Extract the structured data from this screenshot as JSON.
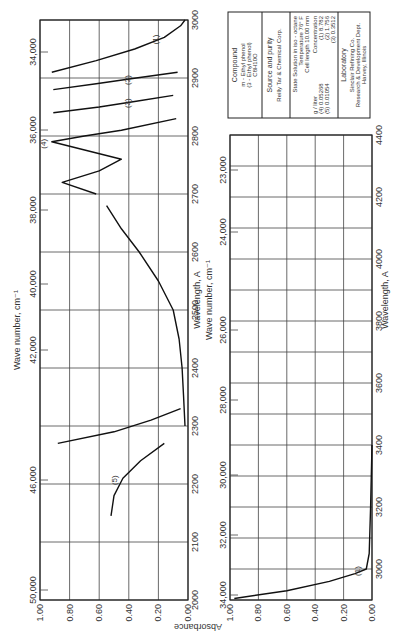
{
  "page": {
    "orientation": "rotated 90 degrees counterclockwise",
    "absorbance_label": "Absorbance"
  },
  "info_box": {
    "compound_heading": "Compound",
    "compound_lines": [
      "m - Ethyl phenol",
      "(3 - Ethyl phenol)",
      "C8H10O"
    ],
    "source_heading": "Source and purity",
    "source_line": "Reilly Tar & Chemical Corp.",
    "state_line": "State  Solution in iso - octane",
    "temperature_line": "Temperature  76° F",
    "cell_line": "Cell length  10.00 mm",
    "concentration_heading": "Concentration",
    "concentration_unit": "g / liter",
    "concentrations": [
      "(1) 8.782",
      "(2) 1.756",
      "(3) 0.3512",
      "(4) 0.05268",
      "(5) 0.01054"
    ],
    "lab_heading": "Laboratory",
    "lab_lines": [
      "Sinclair Refining Co.",
      "Research & Development Dept.",
      "Harvey, Illinois"
    ]
  },
  "chart_data": [
    {
      "type": "line",
      "title": "m-Ethyl phenol UV absorption spectrum (panel 1)",
      "xlabel": "Wavelength, A",
      "x2label": "Wave number, cm⁻¹",
      "ylabel": "Absorbance",
      "xlim": [
        2000,
        3000
      ],
      "ylim": [
        0.0,
        1.0
      ],
      "x_ticks": [
        "2000",
        "2100",
        "2200",
        "2300",
        "2400",
        "2500",
        "2600",
        "2700",
        "2800",
        "2900",
        "3000"
      ],
      "x2_ticks": [
        "50,000",
        "46,000",
        "42,000",
        "40,000",
        "38,000",
        "36,000",
        "34,000"
      ],
      "y_ticks": [
        "1.00",
        "0.80",
        "0.60",
        "0.40",
        "0.20",
        "0.00"
      ],
      "grid": true,
      "series": [
        {
          "name": "(1)",
          "x": [
            2910,
            2930,
            2950,
            2970,
            2990,
            3000
          ],
          "y": [
            0.92,
            0.62,
            0.36,
            0.16,
            0.05,
            0.02
          ]
        },
        {
          "name": "(2)",
          "x": [
            2880,
            2890,
            2900,
            2910
          ],
          "y": [
            0.91,
            0.62,
            0.35,
            0.07
          ]
        },
        {
          "name": "(3)",
          "x": [
            2840,
            2850,
            2860,
            2870
          ],
          "y": [
            0.91,
            0.6,
            0.35,
            0.1
          ]
        },
        {
          "name": "(4)",
          "x": [
            2700,
            2720,
            2740,
            2760,
            2790,
            2800,
            2810,
            2830
          ],
          "y": [
            0.62,
            0.85,
            0.6,
            0.45,
            0.92,
            0.7,
            0.45,
            0.08
          ]
        },
        {
          "name": "(4) main",
          "x": [
            2300,
            2350,
            2400,
            2450,
            2500,
            2550,
            2600,
            2640,
            2680
          ],
          "y": [
            0.02,
            0.03,
            0.04,
            0.06,
            0.1,
            0.2,
            0.33,
            0.45,
            0.55
          ]
        },
        {
          "name": "(5)",
          "x": [
            2145,
            2180,
            2210,
            2240,
            2270
          ],
          "y": [
            0.52,
            0.5,
            0.44,
            0.32,
            0.16
          ]
        },
        {
          "name": "steep",
          "x": [
            2270,
            2290,
            2310,
            2330
          ],
          "y": [
            0.88,
            0.5,
            0.25,
            0.05
          ]
        }
      ]
    },
    {
      "type": "line",
      "title": "m-Ethyl phenol UV absorption spectrum (panel 2)",
      "xlabel": "Wavelength, A",
      "x2label": "Wave number, cm⁻¹",
      "ylabel": "Absorbance",
      "xlim": [
        2900,
        4400
      ],
      "ylim": [
        0.0,
        1.0
      ],
      "x_ticks": [
        "3000",
        "3200",
        "3400",
        "3600",
        "3800",
        "4000",
        "4200",
        "4400"
      ],
      "x2_ticks": [
        "34,000",
        "32,000",
        "30,000",
        "28,000",
        "26,000",
        "24,000",
        "23,000"
      ],
      "y_ticks": [
        "1.00",
        "0.80",
        "0.60",
        "0.40",
        "0.20",
        "0.00"
      ],
      "grid": true,
      "series": [
        {
          "name": "(1)",
          "x": [
            2905,
            2930,
            2960,
            2985,
            3000,
            3050,
            3200,
            3400
          ],
          "y": [
            0.97,
            0.6,
            0.3,
            0.12,
            0.04,
            0.02,
            0.01,
            0.0
          ]
        }
      ]
    }
  ]
}
